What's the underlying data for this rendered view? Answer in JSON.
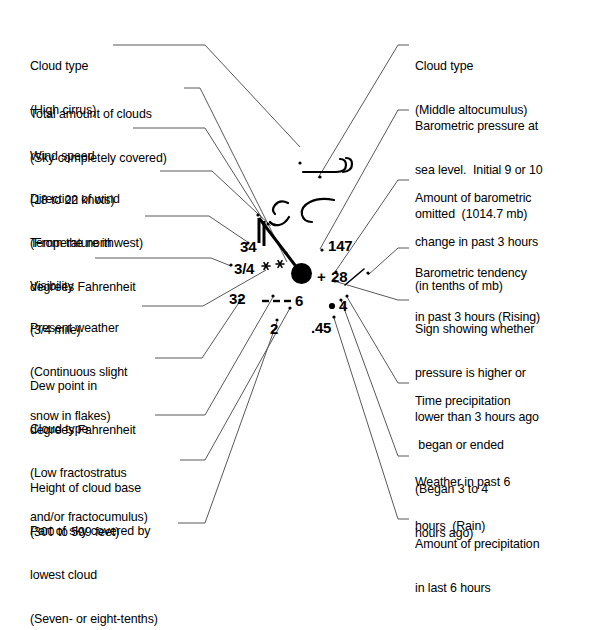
{
  "diagram": {
    "ink_color": "#000000",
    "leader_color": "#58585a"
  },
  "labels_left": [
    {
      "name": "cloud-type-high",
      "lines": [
        "Cloud type",
        "(High cirrus)"
      ],
      "x": 30,
      "y": 30
    },
    {
      "name": "total-amount-of-clouds",
      "lines": [
        "Total amount of clouds",
        "(Sky completely covered)"
      ],
      "x": 30,
      "y": 78
    },
    {
      "name": "wind-speed",
      "lines": [
        "Wind speed",
        "(18 to 22 knots)"
      ],
      "x": 30,
      "y": 120
    },
    {
      "name": "direction-of-wind",
      "lines": [
        "Direction of wind",
        "(From the northwest)"
      ],
      "x": 30,
      "y": 163
    },
    {
      "name": "temperature",
      "lines": [
        "Temperature in",
        "degrees Fahrenheit"
      ],
      "x": 30,
      "y": 207
    },
    {
      "name": "visibility",
      "lines": [
        "Visibility",
        "(3/4 mile)"
      ],
      "x": 30,
      "y": 250
    },
    {
      "name": "present-weather",
      "lines": [
        "Present weather",
        "(Continuous slight",
        "snow in flakes)"
      ],
      "x": 30,
      "y": 292
    },
    {
      "name": "dew-point",
      "lines": [
        "Dew point in",
        "degrees Fahrenheit"
      ],
      "x": 30,
      "y": 350
    },
    {
      "name": "cloud-type-low",
      "lines": [
        "Cloud type",
        "(Low fractostratus",
        "and/or fractocumulus)"
      ],
      "x": 30,
      "y": 393
    },
    {
      "name": "height-of-cloud-base",
      "lines": [
        "Height of cloud base",
        "(300 to 599 feet)"
      ],
      "x": 30,
      "y": 452
    },
    {
      "name": "part-of-sky-covered",
      "lines": [
        "Part of sky covered by",
        "lowest cloud",
        "(Seven- or eight-tenths)"
      ],
      "x": 30,
      "y": 495
    }
  ],
  "labels_right": [
    {
      "name": "cloud-type-middle",
      "lines": [
        "Cloud type",
        "(Middle altocumulus)"
      ],
      "x": 415,
      "y": 30
    },
    {
      "name": "barometric-pressure",
      "lines": [
        "Barometric pressure at",
        "sea level.  Initial 9 or 10",
        "omitted  (1014.7 mb)"
      ],
      "x": 415,
      "y": 90
    },
    {
      "name": "barometric-change-amount",
      "lines": [
        "Amount of barometric",
        "change in past 3 hours",
        "(in tenths of mb)"
      ],
      "x": 415,
      "y": 162
    },
    {
      "name": "barometric-tendency",
      "lines": [
        "Barometric tendency",
        "in past 3 hours (Rising)"
      ],
      "x": 415,
      "y": 237
    },
    {
      "name": "pressure-sign",
      "lines": [
        "Sign showing whether",
        "pressure is higher or",
        "lower than 3 hours ago"
      ],
      "x": 415,
      "y": 293
    },
    {
      "name": "time-precipitation",
      "lines": [
        "Time precipitation",
        " began or ended",
        "(Began 3 to 4",
        "hours ago)"
      ],
      "x": 415,
      "y": 365
    },
    {
      "name": "weather-past-6-hours",
      "lines": [
        "Weather in past 6",
        "hours  (Rain)"
      ],
      "x": 415,
      "y": 446
    },
    {
      "name": "amount-of-precipitation",
      "lines": [
        "Amount of precipitation",
        "in last 6 hours"
      ],
      "x": 415,
      "y": 508
    }
  ],
  "station_model": {
    "temperature": "34",
    "visibility": "3/4",
    "dew_point": "32",
    "pressure": "147",
    "pressure_change_sign": "+",
    "pressure_change": "28",
    "past_weather": "4",
    "precipitation_amount": ".45",
    "cloud_base_height": "6",
    "sky_covered_lowest": "2",
    "present_weather_symbol": "snow-flakes-continuous-slight",
    "low_cloud_symbol": "fractostratus-dashes",
    "past_weather_symbol": "rain-dot",
    "high_cloud_symbol": "cirrus-hook",
    "middle_cloud_symbol": "altocumulus-hook",
    "sky_cover_symbol": "completely-covered-filled-circle",
    "wind_barb_symbol": "two-full-barbs-from-northwest",
    "tendency_symbol": "rising-line"
  }
}
